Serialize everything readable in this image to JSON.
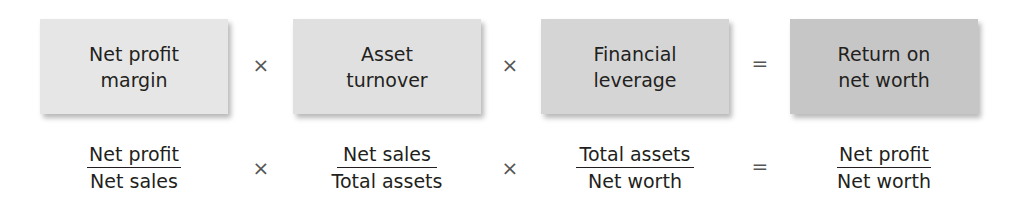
{
  "diagram": {
    "title_concept": "DuPont identity for return on net worth",
    "boxes": [
      {
        "line1": "Net profit",
        "line2": "margin",
        "color": "#e6e6e6"
      },
      {
        "line1": "Asset",
        "line2": "turnover",
        "color": "#e0e0e0"
      },
      {
        "line1": "Financial",
        "line2": "leverage",
        "color": "#d5d5d5"
      },
      {
        "line1": "Return on",
        "line2": "net worth",
        "color": "#c6c6c6"
      }
    ],
    "operators": [
      "×",
      "×",
      "="
    ],
    "fractions": [
      {
        "numerator": "Net profit",
        "denominator": "Net sales"
      },
      {
        "numerator": "Net sales",
        "denominator": "Total assets"
      },
      {
        "numerator": "Total assets",
        "denominator": "Net worth"
      },
      {
        "numerator": "Net profit",
        "denominator": "Net worth"
      }
    ]
  }
}
